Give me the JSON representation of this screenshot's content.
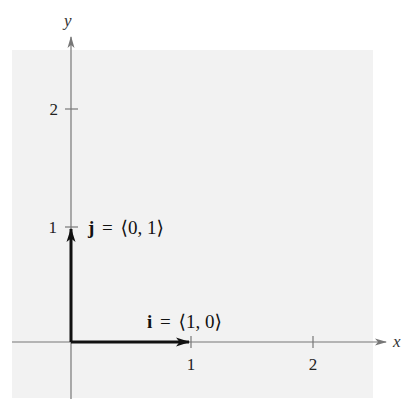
{
  "colors": {
    "background": "#ffffff",
    "panel": "#f2f2f2",
    "axis": "#777777",
    "vector": "#111111",
    "text": "#222222"
  },
  "axes": {
    "x_label": "x",
    "y_label": "y",
    "x_ticks": [
      {
        "value": 1,
        "label": "1"
      },
      {
        "value": 2,
        "label": "2"
      }
    ],
    "y_ticks": [
      {
        "value": 1,
        "label": "1"
      },
      {
        "value": 2,
        "label": "2"
      }
    ]
  },
  "vectors": {
    "i": {
      "symbol": "i",
      "equals": "=",
      "components": "⟨1, 0⟩",
      "from": [
        0,
        0
      ],
      "to": [
        1,
        0
      ]
    },
    "j": {
      "symbol": "j",
      "equals": "=",
      "components": "⟨0, 1⟩",
      "from": [
        0,
        0
      ],
      "to": [
        0,
        1
      ]
    }
  }
}
